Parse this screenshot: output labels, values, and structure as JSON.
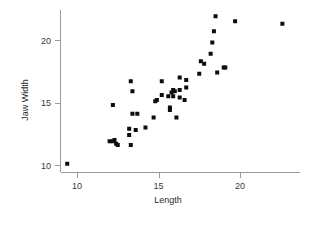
{
  "chart_data": {
    "type": "scatter",
    "title": "",
    "xlabel": "Length",
    "ylabel": "Jaw Width",
    "xlim": [
      9.0,
      23.2
    ],
    "ylim": [
      9.7,
      22.2
    ],
    "xticks": [
      10,
      15,
      20
    ],
    "xtick_labels": [
      "10",
      "15",
      "20"
    ],
    "yticks": [
      10,
      15,
      20
    ],
    "ytick_labels": [
      "10",
      "15",
      "20"
    ],
    "grid": false,
    "legend": null,
    "marker": "square",
    "marker_color": "#0d0d0d",
    "marker_size": 4,
    "n_points": 48,
    "points": [
      {
        "x": 9.4,
        "y": 10.1
      },
      {
        "x": 12.0,
        "y": 11.9
      },
      {
        "x": 12.2,
        "y": 11.9
      },
      {
        "x": 12.3,
        "y": 12.0
      },
      {
        "x": 12.4,
        "y": 11.7
      },
      {
        "x": 12.5,
        "y": 11.6
      },
      {
        "x": 13.3,
        "y": 11.6
      },
      {
        "x": 13.2,
        "y": 12.4
      },
      {
        "x": 12.2,
        "y": 14.8
      },
      {
        "x": 13.2,
        "y": 12.9
      },
      {
        "x": 13.6,
        "y": 12.8
      },
      {
        "x": 13.4,
        "y": 14.1
      },
      {
        "x": 13.7,
        "y": 14.1
      },
      {
        "x": 13.4,
        "y": 15.9
      },
      {
        "x": 13.3,
        "y": 16.7
      },
      {
        "x": 14.2,
        "y": 13.0
      },
      {
        "x": 14.7,
        "y": 13.8
      },
      {
        "x": 14.8,
        "y": 15.1
      },
      {
        "x": 14.9,
        "y": 15.2
      },
      {
        "x": 15.2,
        "y": 15.6
      },
      {
        "x": 15.2,
        "y": 16.7
      },
      {
        "x": 15.6,
        "y": 15.5
      },
      {
        "x": 15.7,
        "y": 14.4
      },
      {
        "x": 15.7,
        "y": 14.6
      },
      {
        "x": 15.8,
        "y": 15.8
      },
      {
        "x": 15.9,
        "y": 16.0
      },
      {
        "x": 15.9,
        "y": 15.5
      },
      {
        "x": 16.0,
        "y": 15.9
      },
      {
        "x": 16.1,
        "y": 13.8
      },
      {
        "x": 16.3,
        "y": 15.4
      },
      {
        "x": 16.3,
        "y": 16.0
      },
      {
        "x": 16.3,
        "y": 17.0
      },
      {
        "x": 16.6,
        "y": 15.2
      },
      {
        "x": 16.7,
        "y": 16.2
      },
      {
        "x": 16.7,
        "y": 16.8
      },
      {
        "x": 17.5,
        "y": 17.3
      },
      {
        "x": 17.6,
        "y": 18.3
      },
      {
        "x": 17.8,
        "y": 18.1
      },
      {
        "x": 18.2,
        "y": 18.9
      },
      {
        "x": 18.3,
        "y": 19.8
      },
      {
        "x": 18.4,
        "y": 20.7
      },
      {
        "x": 18.5,
        "y": 21.9
      },
      {
        "x": 18.6,
        "y": 17.4
      },
      {
        "x": 19.0,
        "y": 17.8
      },
      {
        "x": 19.1,
        "y": 17.8
      },
      {
        "x": 19.7,
        "y": 21.5
      },
      {
        "x": 22.6,
        "y": 21.3
      }
    ]
  },
  "axes": {
    "x_axis_name": "x-axis",
    "y_axis_name": "y-axis"
  }
}
